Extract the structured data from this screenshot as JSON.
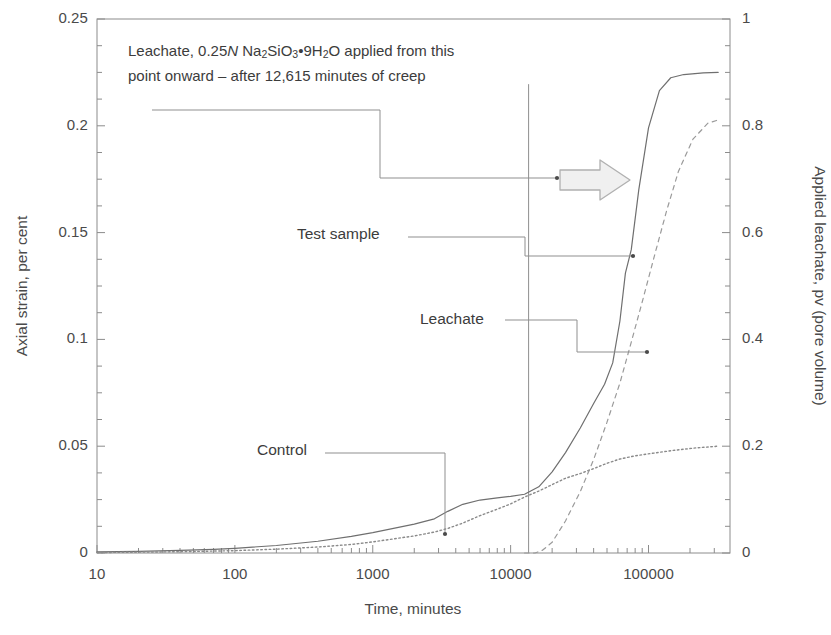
{
  "chart_data": {
    "type": "line",
    "title": "",
    "xlabel": "Time, minutes",
    "ylabel": "Axial strain, per cent",
    "y2label": "Applied leachate, pv (pore volume)",
    "xscale": "log",
    "xlim": [
      10,
      390000
    ],
    "ylim": [
      0,
      0.25
    ],
    "y2lim": [
      0,
      1
    ],
    "grid": false,
    "legend_position": "inline-leader-labels",
    "xticks": [
      10,
      100,
      1000,
      10000,
      100000
    ],
    "xtick_labels": [
      "10",
      "100",
      "1000",
      "10000",
      "100000"
    ],
    "yticks": [
      0,
      0.05,
      0.1,
      0.15,
      0.2,
      0.25
    ],
    "ytick_labels": [
      "0",
      "0.05",
      "0.1",
      "0.15",
      "0.2",
      "0.25"
    ],
    "y2ticks": [
      0,
      0.2,
      0.4,
      0.6,
      0.8,
      1
    ],
    "y2tick_labels": [
      "0",
      "0.2",
      "0.4",
      "0.6",
      "0.8",
      "1"
    ],
    "yminor_step": 0.0125,
    "y2minor_step": 0.05,
    "series": [
      {
        "name": "Test sample",
        "axis": "left",
        "style": "solid",
        "color": "#6f6f6f",
        "points": [
          [
            10,
            0.0005
          ],
          [
            20,
            0.0008
          ],
          [
            40,
            0.0012
          ],
          [
            70,
            0.0017
          ],
          [
            100,
            0.0022
          ],
          [
            200,
            0.0035
          ],
          [
            400,
            0.0055
          ],
          [
            700,
            0.0078
          ],
          [
            1000,
            0.0095
          ],
          [
            2000,
            0.0135
          ],
          [
            2800,
            0.016
          ],
          [
            3500,
            0.0195
          ],
          [
            4500,
            0.0228
          ],
          [
            6000,
            0.0248
          ],
          [
            8000,
            0.0258
          ],
          [
            10000,
            0.0265
          ],
          [
            12615,
            0.0275
          ],
          [
            16000,
            0.031
          ],
          [
            20000,
            0.038
          ],
          [
            25000,
            0.047
          ],
          [
            32000,
            0.0585
          ],
          [
            40000,
            0.07
          ],
          [
            48000,
            0.079
          ],
          [
            55000,
            0.089
          ],
          [
            62000,
            0.1085
          ],
          [
            68000,
            0.131
          ],
          [
            75000,
            0.142
          ],
          [
            85000,
            0.17
          ],
          [
            100000,
            0.199
          ],
          [
            120000,
            0.2165
          ],
          [
            145000,
            0.2225
          ],
          [
            180000,
            0.224
          ],
          [
            250000,
            0.2248
          ],
          [
            320000,
            0.225
          ]
        ]
      },
      {
        "name": "Control",
        "axis": "left",
        "style": "dotted",
        "color": "#8a8a8a",
        "points": [
          [
            10,
            0.0002
          ],
          [
            20,
            0.0004
          ],
          [
            40,
            0.0006
          ],
          [
            70,
            0.0009
          ],
          [
            100,
            0.0011
          ],
          [
            200,
            0.0018
          ],
          [
            400,
            0.0028
          ],
          [
            700,
            0.004
          ],
          [
            1000,
            0.0052
          ],
          [
            2000,
            0.008
          ],
          [
            2800,
            0.0098
          ],
          [
            3500,
            0.0115
          ],
          [
            4500,
            0.014
          ],
          [
            6000,
            0.0175
          ],
          [
            8000,
            0.0205
          ],
          [
            10000,
            0.023
          ],
          [
            12615,
            0.0262
          ],
          [
            16000,
            0.029
          ],
          [
            20000,
            0.032
          ],
          [
            25000,
            0.035
          ],
          [
            32000,
            0.0372
          ],
          [
            40000,
            0.0395
          ],
          [
            50000,
            0.042
          ],
          [
            62000,
            0.044
          ],
          [
            80000,
            0.0455
          ],
          [
            110000,
            0.0468
          ],
          [
            150000,
            0.048
          ],
          [
            220000,
            0.0492
          ],
          [
            320000,
            0.05
          ]
        ]
      },
      {
        "name": "Leachate",
        "axis": "right",
        "style": "dashed",
        "color": "#9a9a9a",
        "points": [
          [
            12615,
            0.0
          ],
          [
            15000,
            0.0
          ],
          [
            17000,
            0.005
          ],
          [
            20000,
            0.02
          ],
          [
            25000,
            0.06
          ],
          [
            32000,
            0.115
          ],
          [
            40000,
            0.175
          ],
          [
            50000,
            0.245
          ],
          [
            62000,
            0.318
          ],
          [
            75000,
            0.395
          ],
          [
            90000,
            0.47
          ],
          [
            110000,
            0.555
          ],
          [
            135000,
            0.64
          ],
          [
            165000,
            0.715
          ],
          [
            210000,
            0.775
          ],
          [
            270000,
            0.805
          ],
          [
            330000,
            0.812
          ]
        ]
      }
    ],
    "event_marker": {
      "label": "leachate-application-start",
      "x": 13500,
      "y_top": 0.2195,
      "y_bottom": 0.0
    },
    "annotations": [
      {
        "name": "leachate-note",
        "line1_prefix": "Leachate, 0.25",
        "line1_italic": "N",
        "line1_formula": " Na2SiO3•9H2O applied from this",
        "line2": "point onward – after 12,615 minutes of creep"
      }
    ]
  },
  "note": {
    "line1_prefix": "Leachate, 0.25",
    "line1_italic": "N",
    "line1_na": "Na",
    "line1_sub2a": "2",
    "line1_sio": "SiO",
    "line1_sub3": "3",
    "line1_dot": "•",
    "line1_9h": "9H",
    "line1_sub2b": "2",
    "line1_o": "O",
    "line1_tail": " applied from this",
    "line2": "point onward – after 12,615 minutes of creep"
  },
  "labels": {
    "test_sample": "Test sample",
    "leachate": "Leachate",
    "control": "Control"
  },
  "axes": {
    "left_title": "Axial strain, per cent",
    "right_title": "Applied leachate, pv (pore volume)",
    "bottom_title": "Time, minutes",
    "left_ticks": [
      "0.25",
      "0.2",
      "0.15",
      "0.1",
      "0.05",
      "0"
    ],
    "right_ticks": [
      "1",
      "0.8",
      "0.6",
      "0.4",
      "0.2",
      "0"
    ],
    "bottom_ticks": [
      "10",
      "100",
      "1000",
      "10000",
      "100000"
    ]
  },
  "colors": {
    "frame": "#8c8c8c",
    "text": "#3c3c3c",
    "series_test": "#6f6f6f",
    "series_control": "#8a8a8a",
    "series_leachate": "#9a9a9a",
    "arrow_stroke": "#b0b0b0",
    "arrow_fill": "#f0f0f0"
  }
}
